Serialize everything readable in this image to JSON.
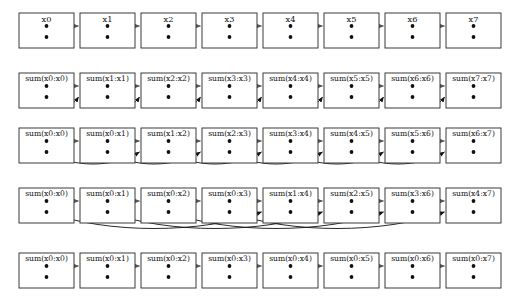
{
  "diagram": {
    "type": "dataflow-diagram",
    "lane_count": 8,
    "row_count": 5,
    "colors": {
      "box_stroke": "#3a3a3a",
      "box_fill": "#ffffff",
      "text": "#111111",
      "straight_arrow": "#555555",
      "curve_arrow": "#111111",
      "background": "#ffffff"
    },
    "geometry": {
      "box_width": 55,
      "box_height": 35,
      "pitch_x": 61,
      "first_box_left": 19,
      "row_tops": [
        13,
        73,
        128,
        188,
        253
      ],
      "dot_offset_top": 13,
      "dot_offset_bottom": 24
    },
    "rows": [
      {
        "index": 0,
        "name": "input-row",
        "stride": 0,
        "stride_label": "input",
        "labels": [
          "x0",
          "x1",
          "x2",
          "x3",
          "x4",
          "x5",
          "x6",
          "x7"
        ],
        "has_curves": false,
        "straight_arrow_count": 7
      },
      {
        "index": 1,
        "name": "step-0-row",
        "stride": 1,
        "stride_label": "stride 1",
        "labels": [
          "sum(x0:x0)",
          "sum(x1:x1)",
          "sum(x2:x2)",
          "sum(x3:x3)",
          "sum(x4:x4)",
          "sum(x5:x5)",
          "sum(x6:x6)",
          "sum(x7:x7)"
        ],
        "has_curves": true,
        "curve_count": 7,
        "straight_arrow_count": 7
      },
      {
        "index": 2,
        "name": "step-1-row",
        "stride": 2,
        "stride_label": "stride 2",
        "labels": [
          "sum(x0:x0)",
          "sum(x0:x1)",
          "sum(x1:x2)",
          "sum(x2:x3)",
          "sum(x3:x4)",
          "sum(x4:x5)",
          "sum(x5:x6)",
          "sum(x6:x7)"
        ],
        "has_curves": true,
        "curve_count": 6,
        "straight_arrow_count": 7
      },
      {
        "index": 3,
        "name": "step-2-row",
        "stride": 4,
        "stride_label": "stride 4",
        "labels": [
          "sum(x0:x0)",
          "sum(x0:x1)",
          "sum(x0:x2)",
          "sum(x0:x3)",
          "sum(x1:x4)",
          "sum(x2:x5)",
          "sum(x3:x6)",
          "sum(x4:x7)"
        ],
        "has_curves": true,
        "curve_count": 4,
        "straight_arrow_count": 7
      },
      {
        "index": 4,
        "name": "result-row",
        "stride": 0,
        "stride_label": "result",
        "labels": [
          "sum(x0:x0)",
          "sum(x0:x1)",
          "sum(x0:x2)",
          "sum(x0:x3)",
          "sum(x0:x4)",
          "sum(x0:x5)",
          "sum(x0:x6)",
          "sum(x0:x7)"
        ],
        "has_curves": false,
        "straight_arrow_count": 7
      }
    ]
  }
}
